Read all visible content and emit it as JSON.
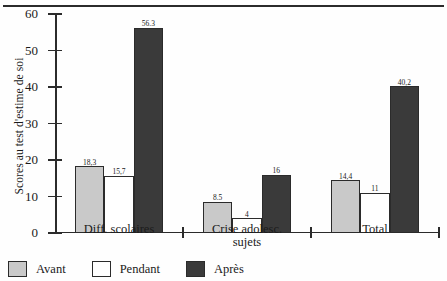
{
  "chart_data": {
    "type": "bar",
    "title": "",
    "xlabel": "",
    "ylabel": "Scores au test d'estime de soi",
    "ylim": [
      0,
      60
    ],
    "yticks": [
      0,
      10,
      20,
      30,
      40,
      50,
      60
    ],
    "ytick_labels": [
      "0",
      "10",
      "20",
      "30",
      "40",
      "50",
      "60"
    ],
    "grid": false,
    "legend_position": "bottom-left",
    "categories": [
      "Diff. scolaires",
      "Crise adolesc. sujets",
      "Total"
    ],
    "category_lines": [
      [
        "Diff. scolaires"
      ],
      [
        "Crise adolesc.",
        "sujets"
      ],
      [
        "Total"
      ]
    ],
    "series": [
      {
        "name": "Avant",
        "color": "#c9c9c9",
        "values": [
          18.3,
          8.5,
          14.4
        ],
        "labels": [
          "18,3",
          "8.5",
          "14,4"
        ]
      },
      {
        "name": "Pendant",
        "color": "#ffffff",
        "values": [
          15.7,
          4,
          11
        ],
        "labels": [
          "15,7",
          "4",
          "11"
        ]
      },
      {
        "name": "Après",
        "color": "#3a3a3a",
        "values": [
          56.3,
          16,
          40.2
        ],
        "labels": [
          "56.3",
          "16",
          "40,2"
        ]
      }
    ]
  },
  "legend": {
    "items": [
      {
        "label": "Avant"
      },
      {
        "label": "Pendant"
      },
      {
        "label": "Après"
      }
    ]
  }
}
